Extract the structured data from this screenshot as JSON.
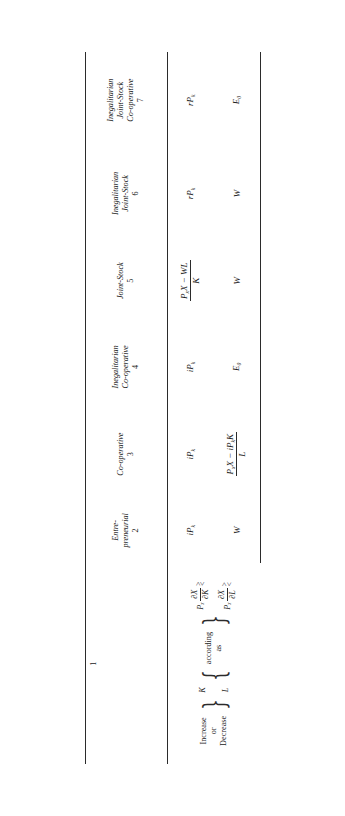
{
  "table": {
    "columns": [
      {
        "id": "col-1",
        "number": "1",
        "header": "",
        "kind": "condition",
        "condition": {
          "prefix": "Increase\nor\nDecrease",
          "variables": [
            "K",
            "L"
          ],
          "connector": "according\nas",
          "expressions": [
            {
              "price": "P",
              "price_sub": "x",
              "partial": "∂X",
              "respect": "∂K",
              "relation": "≷"
            },
            {
              "price": "P",
              "price_sub": "x",
              "partial": "∂X",
              "respect": "∂L",
              "relation": "≷"
            }
          ]
        }
      },
      {
        "id": "col-2",
        "number": "2",
        "header": "Entre-\npreneurial",
        "row2": "iP",
        "row2_sub": "k",
        "row3": "W"
      },
      {
        "id": "col-3",
        "number": "3",
        "header": "Co-operative",
        "row2": "iP",
        "row2_sub": "k",
        "row3_fraction": {
          "numerator": "P",
          "numerator_sub": "x",
          "numerator_rest": "X − iP",
          "numerator_rest_sub": "k",
          "numerator_tail": "K",
          "denominator": "L"
        }
      },
      {
        "id": "col-4",
        "number": "4",
        "header": "Inegalitarian\nCo-operative",
        "row2": "iP",
        "row2_sub": "k",
        "row3": "E",
        "row3_sub": "0"
      },
      {
        "id": "col-5",
        "number": "5",
        "header": "Joint-Stock",
        "row2_fraction": {
          "numerator": "P",
          "numerator_sub": "x",
          "numerator_rest": "X − WL",
          "denominator": "K"
        },
        "row3": "W"
      },
      {
        "id": "col-6",
        "number": "6",
        "header": "Inegalitarian\nJoint-Stock",
        "row2": "rP",
        "row2_sub": "k",
        "row3": "W"
      },
      {
        "id": "col-7",
        "number": "7",
        "header": "Inegalitarian\nJoint-Stock\nCo-operative",
        "row2": "rP",
        "row2_sub": "k",
        "row3": "E",
        "row3_sub": "0"
      }
    ]
  }
}
